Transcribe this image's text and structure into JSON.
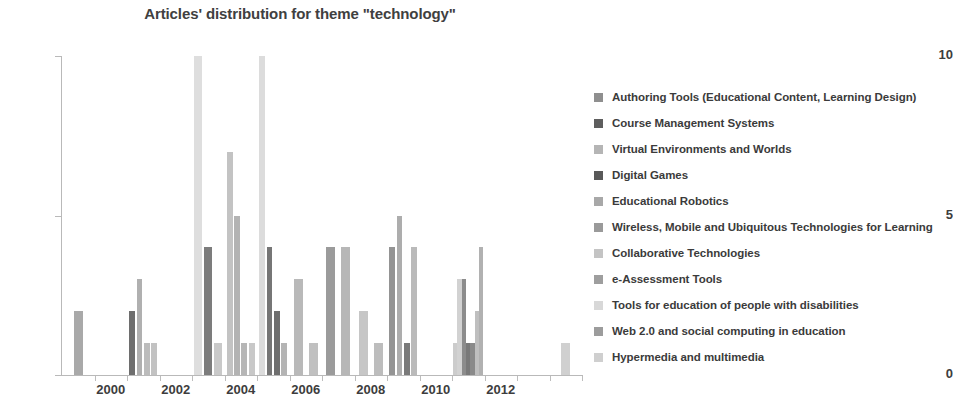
{
  "chart_data": {
    "type": "bar",
    "title": "Articles' distribution for theme \"technology\"",
    "xlabel": "",
    "ylabel": "",
    "ylim": [
      0,
      10
    ],
    "yticks": [
      0,
      5,
      10
    ],
    "xlim": [
      1999,
      2015
    ],
    "xticks": [
      2000,
      2002,
      2004,
      2006,
      2008,
      2010,
      2012
    ],
    "grid": false,
    "legend_position": "right",
    "series": [
      {
        "name": "Authoring Tools (Educational Content, Learning Design)",
        "color": "#8f8f8f"
      },
      {
        "name": "Course Management Systems",
        "color": "#5e5e5e"
      },
      {
        "name": "Virtual Environments and Worlds",
        "color": "#b5b5b5"
      },
      {
        "name": "Digital Games",
        "color": "#595959"
      },
      {
        "name": "Educational Robotics",
        "color": "#a8a8a8"
      },
      {
        "name": "Wireless, Mobile and Ubiquitous Technologies for Learning",
        "color": "#9a9a9a"
      },
      {
        "name": "Collaborative Technologies",
        "color": "#c4c4c4"
      },
      {
        "name": "e-Assessment Tools",
        "color": "#9e9e9e"
      },
      {
        "name": "Tools for education of people with disabilities",
        "color": "#d8d8d8"
      },
      {
        "name": "Web 2.0 and social computing in education",
        "color": "#9c9c9c"
      },
      {
        "name": "Hypermedia and multimedia",
        "color": "#cfcfcf"
      }
    ],
    "bars": [
      {
        "year": 1999,
        "slot": 0,
        "value": 2,
        "color": "#a9a9a9"
      },
      {
        "year": 2001,
        "slot": 0,
        "value": 2,
        "color": "#6e6e6e"
      },
      {
        "year": 2001,
        "slot": 1,
        "value": 3,
        "color": "#b0b0b0"
      },
      {
        "year": 2001,
        "slot": 2,
        "value": 1,
        "color": "#bcbcbc"
      },
      {
        "year": 2001,
        "slot": 3,
        "value": 1,
        "color": "#c2c2c2"
      },
      {
        "year": 2003,
        "slot": 0,
        "value": 10,
        "color": "#dedede"
      },
      {
        "year": 2003,
        "slot": 1,
        "value": 4,
        "color": "#7c7c7c"
      },
      {
        "year": 2003,
        "slot": 2,
        "value": 1,
        "color": "#c9c9c9"
      },
      {
        "year": 2004,
        "slot": 0,
        "value": 7,
        "color": "#c3c3c3"
      },
      {
        "year": 2004,
        "slot": 1,
        "value": 5,
        "color": "#b3b3b3"
      },
      {
        "year": 2004,
        "slot": 2,
        "value": 1,
        "color": "#b6b6b6"
      },
      {
        "year": 2004,
        "slot": 3,
        "value": 1,
        "color": "#c8c8c8"
      },
      {
        "year": 2005,
        "slot": 0,
        "value": 10,
        "color": "#dcdcdc"
      },
      {
        "year": 2005,
        "slot": 1,
        "value": 4,
        "color": "#767676"
      },
      {
        "year": 2005,
        "slot": 2,
        "value": 2,
        "color": "#6f6f6f"
      },
      {
        "year": 2005,
        "slot": 3,
        "value": 1,
        "color": "#b4b4b4"
      },
      {
        "year": 2006,
        "slot": 0,
        "value": 3,
        "color": "#b9b9b9"
      },
      {
        "year": 2006,
        "slot": 1,
        "value": 1,
        "color": "#c0c0c0"
      },
      {
        "year": 2007,
        "slot": 0,
        "value": 4,
        "color": "#9b9b9b"
      },
      {
        "year": 2007,
        "slot": 1,
        "value": 4,
        "color": "#b7b7b7"
      },
      {
        "year": 2008,
        "slot": 0,
        "value": 2,
        "color": "#c6c6c6"
      },
      {
        "year": 2008,
        "slot": 1,
        "value": 1,
        "color": "#bdbdbd"
      },
      {
        "year": 2009,
        "slot": 0,
        "value": 4,
        "color": "#949494"
      },
      {
        "year": 2009,
        "slot": 1,
        "value": 5,
        "color": "#adadad"
      },
      {
        "year": 2009,
        "slot": 2,
        "value": 1,
        "color": "#7a7a7a"
      },
      {
        "year": 2009,
        "slot": 3,
        "value": 4,
        "color": "#bababa"
      },
      {
        "year": 2011,
        "slot": 0,
        "value": 1,
        "color": "#cccccc"
      },
      {
        "year": 2011,
        "slot": 1,
        "value": 3,
        "color": "#d2d2d2"
      },
      {
        "year": 2011,
        "slot": 2,
        "value": 3,
        "color": "#8c8c8c"
      },
      {
        "year": 2011,
        "slot": 3,
        "value": 1,
        "color": "#797979"
      },
      {
        "year": 2011,
        "slot": 4,
        "value": 1,
        "color": "#8a8a8a"
      },
      {
        "year": 2011,
        "slot": 5,
        "value": 2,
        "color": "#bfbfbf"
      },
      {
        "year": 2011,
        "slot": 6,
        "value": 4,
        "color": "#b1b1b1"
      },
      {
        "year": 2014,
        "slot": 0,
        "value": 1,
        "color": "#d0d0d0"
      }
    ]
  }
}
